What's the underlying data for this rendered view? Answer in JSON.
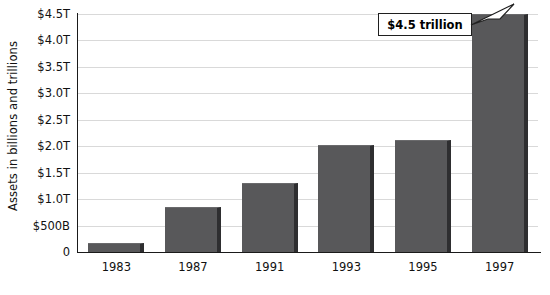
{
  "chart_data": {
    "type": "bar",
    "title": "",
    "subtitle": "",
    "xlabel": "",
    "ylabel": "Assets in billions and trillions",
    "categories": [
      "1983",
      "1987",
      "1991",
      "1993",
      "1995",
      "1997"
    ],
    "values": [
      0.17,
      0.85,
      1.3,
      2.02,
      2.12,
      4.5
    ],
    "value_unit": "trillions of dollars",
    "ylim": [
      0,
      4.5
    ],
    "y_ticks": [
      0,
      0.5,
      1.0,
      1.5,
      2.0,
      2.5,
      3.0,
      3.5,
      4.0,
      4.5
    ],
    "y_tick_labels": [
      "0",
      "$500B",
      "$1.0T",
      "$1.5T",
      "$2.0T",
      "$2.5T",
      "$3.0T",
      "$3.5T",
      "$4.0T",
      "$4.5T"
    ],
    "grid": true,
    "legend": false,
    "legend_position": "none",
    "annotations": [
      {
        "text": "$4.5 trillion",
        "points_at_category": "1997",
        "points_at_value": 4.5
      }
    ],
    "colors": {
      "bar_fill": "#58585a",
      "bar_shadow": "#2e2e30",
      "gridline": "#d9d9d9",
      "axis": "#1a1a1a",
      "background": "#ffffff",
      "text": "#111111"
    }
  }
}
